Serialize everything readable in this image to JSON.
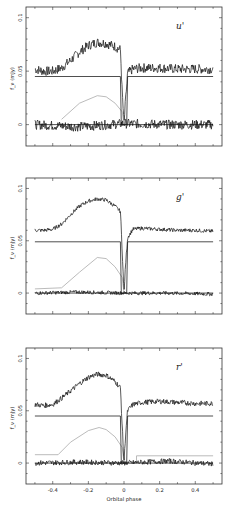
{
  "figure": {
    "xlabel": "Orbital phase",
    "ylabel": "f_ν (mJy)",
    "x_ticks": [
      -0.4,
      -0.2,
      0,
      0.2,
      0.4
    ],
    "x_tick_labels": [
      "-0.4",
      "-0.2",
      "0",
      "0.2",
      "0.4"
    ],
    "y_ticks": [
      0,
      0.05,
      0.1
    ],
    "y_tick_labels": [
      "0",
      "0.05",
      "0.1"
    ]
  },
  "chart_data": [
    {
      "type": "line",
      "title": "u'",
      "band_label": "u'",
      "xlabel": "",
      "ylabel": "f_ν (mJy)",
      "xlim": [
        -0.55,
        0.55
      ],
      "ylim": [
        -0.02,
        0.11
      ],
      "grid": false,
      "series": [
        {
          "name": "observed light curve",
          "x": [
            -0.5,
            -0.45,
            -0.4,
            -0.35,
            -0.3,
            -0.25,
            -0.2,
            -0.15,
            -0.1,
            -0.05,
            -0.02,
            -0.01,
            0,
            0.01,
            0.02,
            0.05,
            0.1,
            0.2,
            0.3,
            0.4,
            0.5
          ],
          "values": [
            0.052,
            0.05,
            0.05,
            0.053,
            0.06,
            0.068,
            0.074,
            0.077,
            0.076,
            0.073,
            0.07,
            0.03,
            0.0,
            0.025,
            0.048,
            0.052,
            0.053,
            0.053,
            0.052,
            0.052,
            0.052
          ]
        },
        {
          "name": "model (white dwarf + disc)",
          "x": [
            -0.5,
            -0.02,
            -0.015,
            0.015,
            0.02,
            0.5
          ],
          "values": [
            0.045,
            0.045,
            0.0,
            0.0,
            0.045,
            0.045
          ]
        },
        {
          "name": "bright spot component",
          "x": [
            -0.35,
            -0.25,
            -0.15,
            -0.1,
            -0.05,
            -0.01,
            0.0
          ],
          "values": [
            0.005,
            0.02,
            0.027,
            0.026,
            0.02,
            0.012,
            0.0
          ]
        },
        {
          "name": "residuals",
          "x": [
            -0.5,
            -0.25,
            0,
            0.25,
            0.5
          ],
          "values": [
            0.0,
            -0.002,
            0.001,
            0.0,
            0.0
          ]
        }
      ]
    },
    {
      "type": "line",
      "title": "g'",
      "band_label": "g'",
      "xlabel": "",
      "ylabel": "f_ν (mJy)",
      "xlim": [
        -0.55,
        0.55
      ],
      "ylim": [
        -0.02,
        0.11
      ],
      "grid": false,
      "series": [
        {
          "name": "observed light curve",
          "x": [
            -0.5,
            -0.45,
            -0.4,
            -0.35,
            -0.3,
            -0.25,
            -0.2,
            -0.15,
            -0.1,
            -0.05,
            -0.02,
            -0.01,
            0,
            0.01,
            0.02,
            0.05,
            0.1,
            0.2,
            0.3,
            0.4,
            0.5
          ],
          "values": [
            0.06,
            0.06,
            0.061,
            0.066,
            0.075,
            0.083,
            0.088,
            0.09,
            0.089,
            0.083,
            0.078,
            0.04,
            0.0,
            0.03,
            0.053,
            0.061,
            0.062,
            0.061,
            0.06,
            0.06,
            0.059
          ]
        },
        {
          "name": "model (white dwarf + disc)",
          "x": [
            -0.5,
            -0.02,
            -0.015,
            0.015,
            0.02,
            0.5
          ],
          "values": [
            0.049,
            0.049,
            0.0,
            0.0,
            0.049,
            0.049
          ]
        },
        {
          "name": "bright spot component",
          "x": [
            -0.5,
            -0.35,
            -0.25,
            -0.15,
            -0.1,
            -0.05,
            -0.01,
            0.0
          ],
          "values": [
            0.004,
            0.005,
            0.02,
            0.034,
            0.033,
            0.025,
            0.015,
            0.0
          ]
        },
        {
          "name": "residuals",
          "x": [
            -0.5,
            -0.25,
            0,
            0.25,
            0.5
          ],
          "values": [
            0.0,
            0.001,
            0.0,
            0.0,
            -0.001
          ]
        }
      ]
    },
    {
      "type": "line",
      "title": "r'",
      "band_label": "r'",
      "xlabel": "Orbital phase",
      "ylabel": "f_ν (mJy)",
      "xlim": [
        -0.55,
        0.55
      ],
      "ylim": [
        -0.02,
        0.11
      ],
      "grid": false,
      "series": [
        {
          "name": "observed light curve",
          "x": [
            -0.5,
            -0.45,
            -0.4,
            -0.35,
            -0.3,
            -0.25,
            -0.2,
            -0.15,
            -0.1,
            -0.05,
            -0.02,
            -0.01,
            0,
            0.01,
            0.02,
            0.05,
            0.1,
            0.2,
            0.3,
            0.4,
            0.5
          ],
          "values": [
            0.056,
            0.055,
            0.056,
            0.062,
            0.069,
            0.076,
            0.082,
            0.085,
            0.084,
            0.078,
            0.072,
            0.035,
            0.0,
            0.03,
            0.05,
            0.056,
            0.058,
            0.059,
            0.058,
            0.057,
            0.057
          ]
        },
        {
          "name": "model (white dwarf + disc)",
          "x": [
            -0.5,
            -0.02,
            -0.015,
            0.015,
            0.02,
            0.5
          ],
          "values": [
            0.045,
            0.045,
            0.0,
            0.0,
            0.045,
            0.045
          ]
        },
        {
          "name": "bright spot component",
          "x": [
            -0.5,
            -0.37,
            -0.3,
            -0.2,
            -0.14,
            -0.1,
            -0.05,
            -0.01,
            0.0,
            0.07,
            0.07,
            0.5
          ],
          "values": [
            0.008,
            0.008,
            0.02,
            0.031,
            0.034,
            0.032,
            0.025,
            0.015,
            0.0,
            0.0,
            0.007,
            0.007
          ]
        },
        {
          "name": "residuals",
          "x": [
            -0.5,
            -0.25,
            0,
            0.25,
            0.5
          ],
          "values": [
            0.0,
            0.001,
            0.0,
            0.002,
            -0.001
          ]
        }
      ]
    }
  ]
}
